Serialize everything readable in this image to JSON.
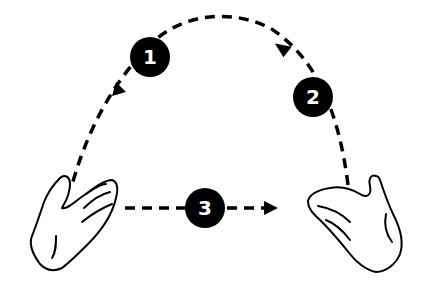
{
  "diagram": {
    "type": "juggling-pattern",
    "steps": [
      {
        "number": "1",
        "description": "arc from right to left hand (arrow pointing down-left)"
      },
      {
        "number": "2",
        "description": "upward throw from right hand (arrow pointing up-left)"
      },
      {
        "number": "3",
        "description": "horizontal pass from left hand to right hand (arrow pointing right)"
      }
    ],
    "colors": {
      "line": "#000000",
      "background": "#ffffff",
      "badge_text": "#ffffff"
    }
  }
}
